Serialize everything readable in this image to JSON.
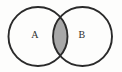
{
  "figure": {
    "type": "venn-diagram",
    "background_color": "#fdfdfc",
    "stroke_color": "#2a2a2a",
    "stroke_width": 1.9,
    "intersection_fill": "#a8a8a8",
    "circle_fill": "#ffffff",
    "label_color": "#2e2e2e"
  },
  "sets": [
    {
      "id": "set-a",
      "label": "A",
      "label_x": 35,
      "label_y": 36,
      "center_x": 38,
      "center_y": 36.5,
      "radius": 29.5
    },
    {
      "id": "set-b",
      "label": "B",
      "label_x": 82,
      "label_y": 36,
      "center_x": 82.5,
      "center_y": 36.5,
      "radius": 29.5
    }
  ],
  "intersection": {
    "id": "a-intersect-b",
    "label": "",
    "shaded": true,
    "fill": "#a8a8a8",
    "left_edge_x": 53,
    "right_edge_x": 68,
    "top_y": 13,
    "bottom_y": 60
  },
  "chart_data": {
    "type": "venn",
    "xlabel": "",
    "ylabel": "",
    "sets": [
      "A",
      "B"
    ],
    "regions": [
      {
        "name": "A only",
        "shaded": false
      },
      {
        "name": "B only",
        "shaded": false
      },
      {
        "name": "A ∩ B",
        "shaded": true
      }
    ],
    "legend": [],
    "grid": false
  }
}
